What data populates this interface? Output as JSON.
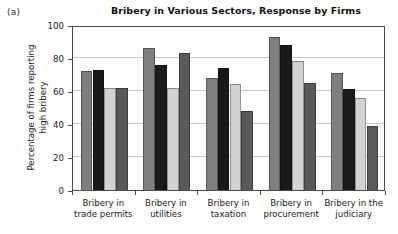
{
  "panel": {
    "label": "(a)"
  },
  "chart_data": {
    "type": "bar",
    "title": "Bribery in Various Sectors, Response by Firms",
    "xlabel": "",
    "ylabel_line1": "Percentage of firms reporting",
    "ylabel_line2": "high bribery",
    "ylim": [
      0,
      100
    ],
    "yticks": [
      0,
      20,
      40,
      60,
      80,
      100
    ],
    "grid": true,
    "legend": "none",
    "categories": [
      "Bribery in trade permits",
      "Bribery in utilities",
      "Bribery in taxation",
      "Bribery in procurement",
      "Bribery in the judiciary"
    ],
    "category_lines": [
      [
        "Bribery in",
        "trade permits"
      ],
      [
        "Bribery in",
        "utilities"
      ],
      [
        "Bribery in",
        "taxation"
      ],
      [
        "Bribery in",
        "procurement"
      ],
      [
        "Bribery in the",
        "judiciary"
      ]
    ],
    "series": [
      {
        "name": "series-1",
        "color": "#7f7f7f",
        "values": [
          72,
          86,
          68,
          93,
          71
        ]
      },
      {
        "name": "series-2",
        "color": "#1a1a1a",
        "values": [
          73,
          76,
          74,
          88,
          61
        ]
      },
      {
        "name": "series-3",
        "color": "#d2d2d2",
        "values": [
          62,
          62,
          64,
          78,
          56
        ]
      },
      {
        "name": "series-4",
        "color": "#5a5a5a",
        "values": [
          62,
          83,
          48,
          65,
          39
        ]
      }
    ]
  }
}
